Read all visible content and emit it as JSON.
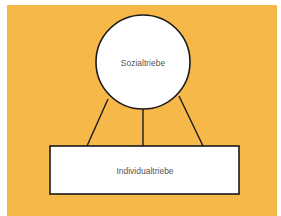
{
  "diagram": {
    "background_color": "#f7b84a",
    "top_node": {
      "shape": "circle",
      "label": "Sozialtriebe"
    },
    "bottom_node": {
      "shape": "rectangle",
      "label": "Individualtriebe"
    },
    "connectors": 3
  }
}
